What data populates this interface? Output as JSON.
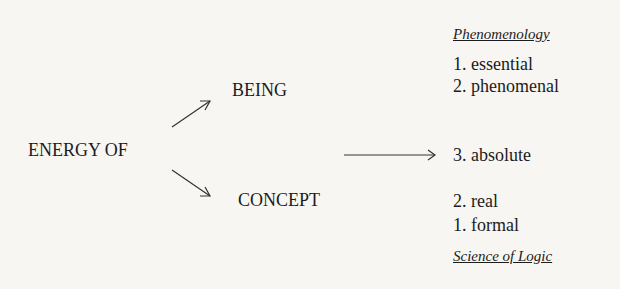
{
  "diagram": {
    "source": "ENERGY OF",
    "branches": {
      "upper": "BEING",
      "lower": "CONCEPT"
    },
    "top_heading": "Phenomenology",
    "top_items": [
      "1. essential",
      "2. phenomenal"
    ],
    "middle_item": "3. absolute",
    "bottom_items": [
      "2. real",
      "1. formal"
    ],
    "bottom_heading": "Science of Logic"
  }
}
